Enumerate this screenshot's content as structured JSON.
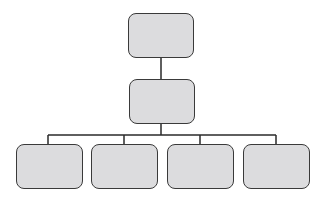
{
  "diagram": {
    "type": "org-chart",
    "colors": {
      "node_fill": "#dcdcde",
      "node_border": "#3a3a3a",
      "connector": "#2a2a2a"
    },
    "root": {
      "label": ""
    },
    "level2": {
      "label": ""
    },
    "children": [
      {
        "label": ""
      },
      {
        "label": ""
      },
      {
        "label": ""
      },
      {
        "label": ""
      }
    ]
  }
}
